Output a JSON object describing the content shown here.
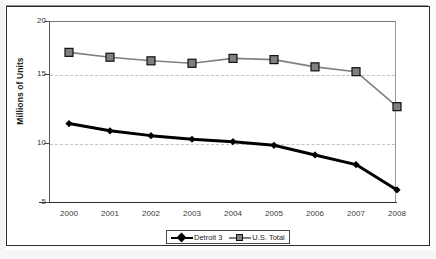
{
  "chart_data": {
    "type": "line",
    "title": "",
    "xlabel": "",
    "ylabel": "Millions of Units",
    "categories": [
      "2000",
      "2001",
      "2002",
      "2003",
      "2004",
      "2005",
      "2006",
      "2007",
      "2008"
    ],
    "series": [
      {
        "name": "Detroit 3",
        "marker": "diamond",
        "color": "#000000",
        "values": [
          11.5,
          10.9,
          10.5,
          10.2,
          10.0,
          9.7,
          8.9,
          8.1,
          6.0
        ]
      },
      {
        "name": "U.S. Total",
        "marker": "square",
        "color": "#808080",
        "values": [
          17.4,
          17.0,
          16.7,
          16.5,
          16.9,
          16.8,
          16.2,
          15.8,
          12.9
        ]
      }
    ],
    "ylim": [
      5,
      20
    ],
    "yticks": [
      5,
      10,
      15,
      20
    ],
    "ytick_labels": [
      "5",
      "10",
      "15",
      "20"
    ],
    "grid": true,
    "grid_axis": "y",
    "legend_position": "bottom"
  },
  "legend": {
    "entries": [
      {
        "label": "Detroit 3",
        "marker": "diamond",
        "color": "#000000"
      },
      {
        "label": "U.S. Total",
        "marker": "square",
        "color": "#808080"
      }
    ]
  },
  "colors": {
    "detroit3": "#000000",
    "us_total": "#808080",
    "axis": "#2e2e2e",
    "grid": "#c2c2c2",
    "frame": "#2b2b2b"
  }
}
